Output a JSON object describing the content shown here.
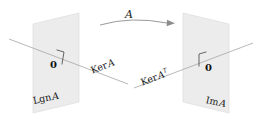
{
  "figure": {
    "title_visible": false,
    "background_color": "#ffffff",
    "plane_fill_color": "#ececec",
    "plane_edge_color": "#d2d2d2",
    "line_color": "#9a9a9a",
    "text_color": "#1a1a1a"
  },
  "map": {
    "label": "A",
    "arrow_direction": "left-to-right",
    "arrow_style": "curved"
  },
  "left_plane": {
    "origin_label": "0",
    "line_label_prefix": "Ker",
    "line_label_operator": "A",
    "subspace_label_prefix": "Lgn",
    "subspace_label_operator": "A"
  },
  "right_plane": {
    "origin_label": "0",
    "line_label_prefix": "Ker",
    "line_label_operator": "A",
    "line_label_superscript": "T",
    "subspace_label_prefix": "Im",
    "subspace_label_operator": "A"
  }
}
